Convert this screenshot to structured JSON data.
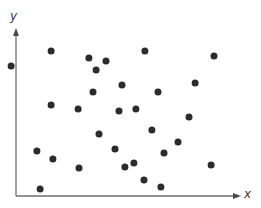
{
  "chart_data": {
    "type": "scatter",
    "title": "",
    "xlabel": "x",
    "ylabel": "y",
    "grid": false,
    "legend": null,
    "axis_ticks": false,
    "note": "Axes have no tick marks or numeric labels; coordinates below are normalized to the plot area (x: 0 = y-axis, 100 = x-axis arrow tip; y: 0 = x-axis, 100 = y-axis arrow tip). One point lies slightly left of the y-axis (negative x).",
    "xlim": [
      0,
      100
    ],
    "ylim": [
      0,
      100
    ],
    "points": [
      {
        "x": -2.2,
        "y": 77.4
      },
      {
        "x": 15.6,
        "y": 86.3
      },
      {
        "x": 32.4,
        "y": 82.1
      },
      {
        "x": 40.0,
        "y": 80.4
      },
      {
        "x": 35.6,
        "y": 75.0
      },
      {
        "x": 57.3,
        "y": 86.3
      },
      {
        "x": 88.0,
        "y": 83.3
      },
      {
        "x": 47.1,
        "y": 66.1
      },
      {
        "x": 79.6,
        "y": 67.3
      },
      {
        "x": 63.1,
        "y": 61.9
      },
      {
        "x": 15.6,
        "y": 54.2
      },
      {
        "x": 27.6,
        "y": 51.8
      },
      {
        "x": 34.2,
        "y": 61.9
      },
      {
        "x": 45.8,
        "y": 50.6
      },
      {
        "x": 53.3,
        "y": 51.8
      },
      {
        "x": 76.9,
        "y": 47.0
      },
      {
        "x": 60.4,
        "y": 39.3
      },
      {
        "x": 36.9,
        "y": 36.9
      },
      {
        "x": 9.3,
        "y": 26.8
      },
      {
        "x": 16.4,
        "y": 22.0
      },
      {
        "x": 28.0,
        "y": 16.7
      },
      {
        "x": 44.0,
        "y": 28.0
      },
      {
        "x": 65.8,
        "y": 25.6
      },
      {
        "x": 72.0,
        "y": 32.1
      },
      {
        "x": 48.4,
        "y": 17.3
      },
      {
        "x": 52.4,
        "y": 19.6
      },
      {
        "x": 86.7,
        "y": 18.5
      },
      {
        "x": 56.9,
        "y": 9.5
      },
      {
        "x": 64.4,
        "y": 5.4
      },
      {
        "x": 10.7,
        "y": 4.2
      }
    ],
    "marker": {
      "shape": "circle",
      "color": "#2b2b2b",
      "radius_px": 3.5
    },
    "axis_color": "#6e6e6e"
  },
  "layout_px": {
    "origin": [
      16,
      196
    ],
    "x_axis_end": [
      241,
      196
    ],
    "y_axis_end": [
      16,
      28
    ],
    "point_pixels": [
      [
        21,
        66
      ],
      [
        51,
        51
      ],
      [
        89,
        58
      ],
      [
        106,
        61
      ],
      [
        96,
        70
      ],
      [
        145,
        51
      ],
      [
        214,
        56
      ],
      [
        122,
        85
      ],
      [
        195,
        83
      ],
      [
        158,
        92
      ],
      [
        51,
        105
      ],
      [
        78,
        109
      ],
      [
        93,
        92
      ],
      [
        119,
        111
      ],
      [
        136,
        109
      ],
      [
        189,
        117
      ],
      [
        152,
        130
      ],
      [
        99,
        134
      ],
      [
        37,
        151
      ],
      [
        53,
        159
      ],
      [
        79,
        168
      ],
      [
        115,
        149
      ],
      [
        164,
        153
      ],
      [
        178,
        142
      ],
      [
        125,
        167
      ],
      [
        134,
        163
      ],
      [
        211,
        165
      ],
      [
        144,
        180
      ],
      [
        161,
        187
      ],
      [
        40,
        189
      ]
    ]
  }
}
